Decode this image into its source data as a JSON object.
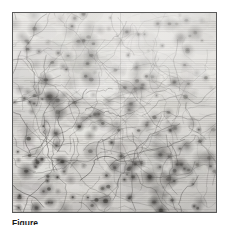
{
  "figure": {
    "panel": {
      "kind": "micrograph",
      "modality": "light-microscopy-grayscale",
      "alt_text": "Grayscale micrograph of a dense field of dark stained cell bodies connected by thin branching filaments",
      "border_color": "#595959",
      "background_color": "#d8d6d2",
      "ink_color": "#3c3a38",
      "highlight_color": "#f2f1ee",
      "width_px": 205,
      "height_px": 201,
      "texture": {
        "puncta_count": 250,
        "filament_count": 150,
        "fiber_count": 320,
        "seed": 20240617,
        "scanline_spacing_px": 1.9,
        "illumination": "brighter upper-right, darker lower-left",
        "seam_position_pct": 52.5
      }
    },
    "caption": {
      "label": "Figure",
      "text": "",
      "clipped": true
    }
  },
  "page": {
    "background_color": "#ffffff",
    "width_px": 230,
    "height_px": 225
  }
}
